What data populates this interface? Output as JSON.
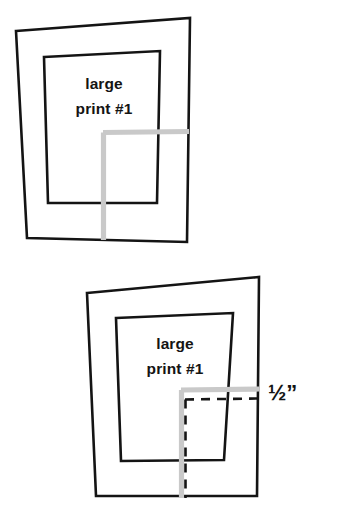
{
  "diagram": {
    "background_color": "#ffffff",
    "ink_color": "#141414",
    "guide_color": "#c9c9c9",
    "figures": [
      {
        "id": "top-figure",
        "name": "mat-board-without-offset",
        "mat_label_line1": "large",
        "mat_label_line2": "print #1",
        "mat_outline_points": "16,31 190,18 187,242 27,238",
        "window_outline_points": "44,57 160,51 157,203 48,203",
        "guide_horizontal_path": "M 103 132.5 L 189 131.5",
        "guide_vertical_path": "M 103.5 132.5 L 103.5 240",
        "label_x": 104,
        "label_y1": 89,
        "label_y2": 114
      },
      {
        "id": "bottom-figure",
        "name": "mat-board-with-half-inch-offset",
        "mat_label_line1": "large",
        "mat_label_line2": "print #1",
        "mat_outline_points": "87,293 259,277 257,496 96,496",
        "window_outline_points": "116,318 233,313 224,460 121,461",
        "guide_horizontal_path": "M 181 390 L 259 389",
        "guide_vertical_path": "M 181.5 390 L 181.5 498",
        "dashed_horizontal_path": "M 185 399.5 L 258 398.5",
        "dashed_vertical_path": "M 185.5 399.5 L 185.5 498",
        "label_x": 175,
        "label_y1": 349,
        "label_y2": 374,
        "dimension_label": "½”",
        "dimension_label_x": 268,
        "dimension_label_y": 400
      }
    ]
  }
}
